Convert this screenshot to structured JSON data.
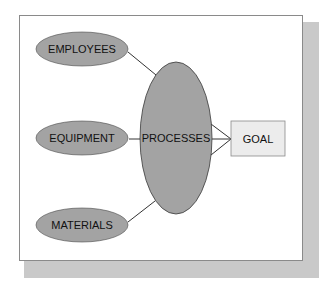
{
  "diagram": {
    "colors": {
      "ellipse_fill": "#a3a3a3",
      "ellipse_stroke": "#4a4a4a",
      "goal_fill": "#ececec",
      "goal_stroke": "#8a8a8a",
      "connector": "#333333",
      "shadow": "#c9c9c9",
      "frame_border": "#8a8a8a"
    },
    "inputs": [
      {
        "id": "employees",
        "label": "EMPLOYEES"
      },
      {
        "id": "equipment",
        "label": "EQUIPMENT"
      },
      {
        "id": "materials",
        "label": "MATERIALS"
      }
    ],
    "center": {
      "id": "processes",
      "label": "PROCESSES"
    },
    "output": {
      "id": "goal",
      "label": "GOAL"
    },
    "edges": [
      {
        "from": "employees",
        "to": "processes"
      },
      {
        "from": "equipment",
        "to": "processes"
      },
      {
        "from": "materials",
        "to": "processes"
      },
      {
        "from": "processes",
        "to": "goal",
        "count": 3
      }
    ]
  }
}
